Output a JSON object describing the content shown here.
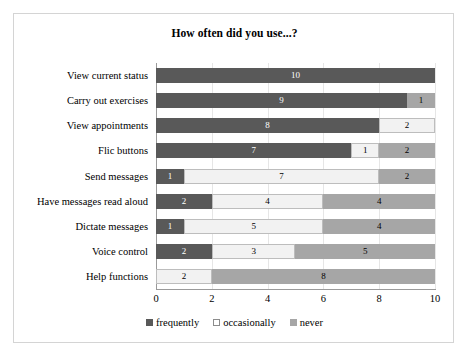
{
  "chart_data": {
    "type": "bar",
    "subtype": "stacked-horizontal",
    "title": "How often did you use...?",
    "xlabel": "",
    "ylabel": "",
    "xlim": [
      0,
      10
    ],
    "xticks": [
      0,
      2,
      4,
      6,
      8,
      10
    ],
    "grid": true,
    "legend_position": "bottom",
    "categories": [
      "View current status",
      "Carry out exercises",
      "View appointments",
      "Flic buttons",
      "Send messages",
      "Have messages read aloud",
      "Dictate messages",
      "Voice control",
      "Help functions"
    ],
    "series": [
      {
        "name": "frequently",
        "color": "#595959",
        "values": [
          10,
          9,
          8,
          7,
          1,
          2,
          1,
          2,
          0
        ]
      },
      {
        "name": "occasionally",
        "color": "#f2f2f2",
        "values": [
          0,
          0,
          2,
          1,
          7,
          4,
          5,
          3,
          2
        ]
      },
      {
        "name": "never",
        "color": "#a6a6a6",
        "values": [
          0,
          1,
          0,
          2,
          2,
          4,
          4,
          5,
          8
        ]
      }
    ],
    "bar_labels": [
      [
        "10",
        "",
        ""
      ],
      [
        "9",
        "",
        "1"
      ],
      [
        "8",
        "2",
        ""
      ],
      [
        "7",
        "1",
        "2"
      ],
      [
        "1",
        "7",
        "2"
      ],
      [
        "2",
        "4",
        "4"
      ],
      [
        "1",
        "5",
        "4"
      ],
      [
        "2",
        "3",
        "5"
      ],
      [
        "",
        "2",
        "8"
      ]
    ]
  }
}
